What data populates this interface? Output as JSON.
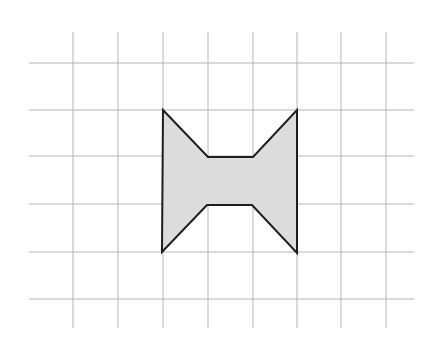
{
  "diagram": {
    "type": "grid-polygon",
    "grid": {
      "vertical_lines_x": [
        73,
        118,
        163,
        208,
        253,
        297,
        341,
        386
      ],
      "vertical_span_y": [
        32,
        328
      ],
      "horizontal_lines_y": [
        63,
        110,
        156,
        204,
        252,
        299
      ],
      "horizontal_span_x": [
        29,
        414
      ],
      "line_color": "#b5b5b5",
      "line_width": 1
    },
    "shape": {
      "name": "bow-tie polygon",
      "fill_color": "#dcdcdc",
      "stroke_color": "#1e1e1e",
      "stroke_width": 2,
      "vertices_px": [
        [
          163,
          110
        ],
        [
          208,
          157
        ],
        [
          253,
          157
        ],
        [
          297,
          110
        ],
        [
          297,
          253
        ],
        [
          252,
          205
        ],
        [
          207,
          205
        ],
        [
          162,
          252
        ]
      ],
      "vertices_grid_units": [
        [
          0,
          0
        ],
        [
          1,
          1
        ],
        [
          2,
          1
        ],
        [
          3,
          0
        ],
        [
          3,
          3
        ],
        [
          2,
          2
        ],
        [
          1,
          2
        ],
        [
          0,
          3
        ]
      ]
    }
  }
}
